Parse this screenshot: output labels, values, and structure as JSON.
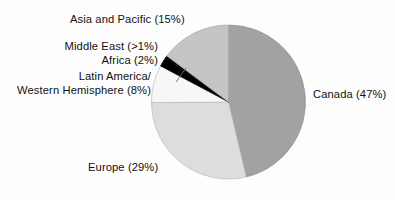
{
  "chart_data": {
    "type": "pie",
    "title": "",
    "subtitle": "",
    "xlabel": "",
    "ylabel": "",
    "legend_position": "none",
    "grid": false,
    "start_angle_deg": 0,
    "direction": "clockwise",
    "categories": [
      "Canada",
      "Europe",
      "Latin America/Western Hemisphere",
      "Africa",
      "Middle East",
      "Asia and Pacific"
    ],
    "values": [
      47,
      29,
      8,
      2,
      0.5,
      15
    ],
    "value_unit": "percent",
    "colors": [
      "#a2a2a2",
      "#dddddd",
      "#f7f7f7",
      "#000000",
      "#000000",
      "#c5c5c5"
    ],
    "slices": [
      {
        "name": "Canada",
        "value": 47,
        "label": "Canada (47%)",
        "color": "#a2a2a2"
      },
      {
        "name": "Europe",
        "value": 29,
        "label": "Europe (29%)",
        "color": "#dddddd"
      },
      {
        "name": "Latin America/Western Hemisphere",
        "value": 8,
        "label": "Latin America/ Western Hemisphere (8%)",
        "color": "#f7f7f7"
      },
      {
        "name": "Africa",
        "value": 2,
        "label": "Africa (2%)",
        "color": "#000000"
      },
      {
        "name": "Middle East",
        "value": 0.5,
        "label": "Middle East (>1%)",
        "color": "#000000"
      },
      {
        "name": "Asia and Pacific",
        "value": 15,
        "label": "Asia and Pacific (15%)",
        "color": "#c5c5c5"
      }
    ]
  },
  "labels": {
    "asia": "Asia and Pacific (15%)",
    "middle_east": "Middle East (>1%)",
    "africa": "Africa (2%)",
    "latin_line1": "Latin America/",
    "latin_line2": "Western Hemisphere (8%)",
    "canada": "Canada (47%)",
    "europe": "Europe (29%)"
  },
  "style": {
    "background": "#fdfdfd",
    "text_color": "#111111",
    "outline_color": "#8a8a8a"
  }
}
